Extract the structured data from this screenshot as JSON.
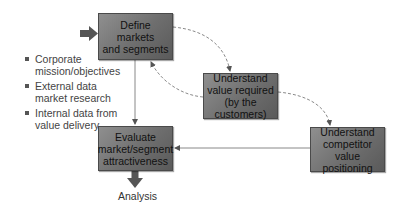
{
  "diagram": {
    "boxes": {
      "define": "Define markets\nand segments",
      "value": "Understand\nvalue required\n(by the customers)",
      "competitor": "Understand\ncompetitor value\npositioning",
      "evaluate": "Evaluate\nmarket/segment\nattractiveness"
    },
    "inputs": [
      "Corporate\nmission/objectives",
      "External data\nmarket research",
      "Internal data from\nvalue delivery"
    ],
    "output_label": "Analysis",
    "colors": {
      "box_fill": "#7a7a7a",
      "box_border": "#4a4a4a",
      "arrow": "#555555",
      "dashed_line": "#8a8a8a",
      "solid_line": "#888888"
    }
  }
}
